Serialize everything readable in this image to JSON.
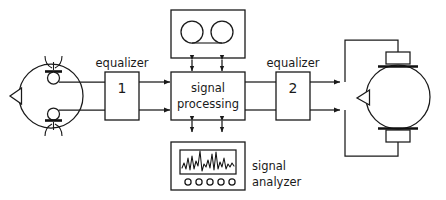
{
  "diagram": {
    "type": "block-diagram",
    "background_color": "#ffffff",
    "line_color": "#1a1a1a",
    "blocks": {
      "equalizer_1": {
        "label": "equalizer",
        "number": "1",
        "inputs": 2,
        "outputs": 2
      },
      "signal_processing": {
        "label_line1": "signal",
        "label_line2": "processing",
        "inputs": 2,
        "outputs": 2
      },
      "equalizer_2": {
        "label": "equalizer",
        "number": "2",
        "inputs": 2,
        "outputs": 2
      },
      "tape_recorder": {
        "icon": "tape-reels-icon",
        "reels": 2,
        "connections": 2,
        "connection_type": "bidirectional"
      },
      "signal_analyzer": {
        "label_line1": "signal",
        "label_line2": "analyzer",
        "icon": "waveform-screen-icon",
        "knobs": 5,
        "connections": 2,
        "connection_type": "bidirectional"
      },
      "head_microphones": {
        "icon": "head-with-in-ear-microphones-icon",
        "microphones": 2,
        "orientation": "nose-left"
      },
      "head_headphones": {
        "icon": "head-with-headphones-icon",
        "earpieces": 2,
        "orientation": "nose-left"
      }
    }
  }
}
